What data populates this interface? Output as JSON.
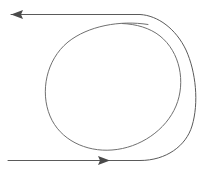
{
  "canvas": {
    "width": 206,
    "height": 175,
    "background": "#ffffff",
    "title": "loop-with-arrows-diagram"
  },
  "style": {
    "stroke_color": "#5a5a5a",
    "stroke_color_light": "#707070",
    "arrow_fill": "#4a4a4a",
    "stroke_width": 1
  },
  "figure": {
    "type": "loop-trajectory",
    "elements": [
      {
        "name": "entry-line",
        "kind": "straight-segment",
        "from": [
          8,
          160
        ],
        "to": [
          140,
          160
        ],
        "direction": "rightward",
        "arrow": "mid"
      },
      {
        "name": "entry-arrowhead",
        "kind": "arrowhead",
        "tip": [
          108,
          160
        ],
        "direction": "right"
      },
      {
        "name": "outer-sweep",
        "kind": "arc",
        "description": "Outer arc sweeping from the lower line up the right side and back to the upper line",
        "rightmost_x": 194,
        "top_y": 14,
        "bottom_y": 160
      },
      {
        "name": "inner-loop",
        "kind": "closed-oval",
        "center": [
          113,
          86
        ],
        "radius_x": 69,
        "radius_y": 63,
        "top_y": 23,
        "bottom_y": 150,
        "left_x": 44,
        "right_x": 182
      },
      {
        "name": "exit-line",
        "kind": "straight-segment",
        "from": [
          140,
          14
        ],
        "to": [
          11,
          14
        ],
        "direction": "leftward",
        "arrow": "end"
      },
      {
        "name": "exit-arrowhead",
        "kind": "arrowhead",
        "tip": [
          11,
          14
        ],
        "direction": "left"
      }
    ],
    "paths": {
      "trajectory": "M 8,160.5 L 140,160.5 C 166,160.5 186,146 192,126 C 199,103 196,72 186,50 C 176,29 158,15.5 140,14.5 L 11,14.5",
      "loop": "M 148,24.5 C 120,20 88,26 68,42 C 46,60 40,92 50,116 C 60,140 86,152 112,150 C 140,148 166,130 176,106 C 186,82 180,52 160,36 C 150,28 136,24 122,23.5"
    }
  },
  "arrowheads": {
    "left_arrow": {
      "name": "left-arrowhead",
      "points": "11,14.5 23,10 21,14.5 23,19",
      "tip_x": 11,
      "tip_y": 14.5
    },
    "right_arrow": {
      "name": "right-arrowhead",
      "points": "110,160.5 98,156 100,160.5 98,165",
      "tip_x": 110,
      "tip_y": 160.5
    }
  }
}
